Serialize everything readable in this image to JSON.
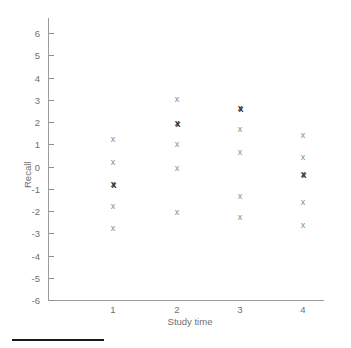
{
  "chart_data": {
    "type": "scatter",
    "title": "",
    "xlabel": "Study time",
    "ylabel": "Recall",
    "xlim": [
      0.4,
      4.7
    ],
    "ylim": [
      -6,
      6.6
    ],
    "grid": false,
    "legend": "none",
    "marker": "x",
    "marker_color": "#8a8a8a",
    "stacked_marker_color": "#3a3a3a",
    "axis_color": "#9a9a9a",
    "x_ticks": [
      1,
      2,
      3,
      4
    ],
    "x_tick_labels": [
      "1",
      "2",
      "3",
      "4"
    ],
    "y_ticks": [
      6,
      5,
      4,
      3,
      2,
      1,
      0,
      -1,
      -2,
      -3,
      -4,
      -5,
      -6
    ],
    "y_tick_labels": [
      "6",
      "5",
      "4",
      "3",
      "2",
      "1",
      "0",
      "-1",
      "-2",
      "-3",
      "-4",
      "-5",
      "-6"
    ],
    "note": "Each column of x markers is a group of residual values at one study-time level; darker bold markers are two coincident points.",
    "points": [
      {
        "x": 1,
        "y": 1.2,
        "count": 1
      },
      {
        "x": 1,
        "y": 0.2,
        "count": 1
      },
      {
        "x": 1,
        "y": -0.8,
        "count": 2
      },
      {
        "x": 1,
        "y": -1.8,
        "count": 1
      },
      {
        "x": 1,
        "y": -2.8,
        "count": 1
      },
      {
        "x": 2,
        "y": 3.0,
        "count": 1
      },
      {
        "x": 2,
        "y": 1.95,
        "count": 2
      },
      {
        "x": 2,
        "y": 1.0,
        "count": 1
      },
      {
        "x": 2,
        "y": -0.1,
        "count": 1
      },
      {
        "x": 2,
        "y": -2.05,
        "count": 1
      },
      {
        "x": 3,
        "y": 2.6,
        "count": 2
      },
      {
        "x": 3,
        "y": 1.65,
        "count": 1
      },
      {
        "x": 3,
        "y": 0.65,
        "count": 1
      },
      {
        "x": 3,
        "y": -1.35,
        "count": 1
      },
      {
        "x": 3,
        "y": -2.3,
        "count": 1
      },
      {
        "x": 4,
        "y": 1.4,
        "count": 1
      },
      {
        "x": 4,
        "y": 0.4,
        "count": 1
      },
      {
        "x": 4,
        "y": -0.35,
        "count": 2
      },
      {
        "x": 4,
        "y": -1.6,
        "count": 1
      },
      {
        "x": 4,
        "y": -2.65,
        "count": 1
      }
    ]
  }
}
